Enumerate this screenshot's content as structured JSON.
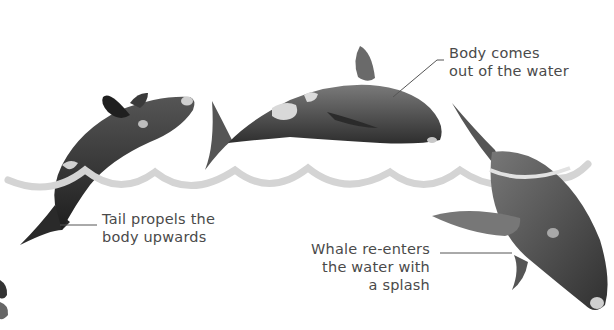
{
  "figure": {
    "colors": {
      "background": "#ffffff",
      "wave": "#d2d2d2",
      "whale_dark": "#2e2e2e",
      "whale_mid": "#5a5a5a",
      "whale_patch": "#d8d8d8",
      "label_text": "#4a4a4a",
      "leader_line": "#555555"
    },
    "labels": [
      {
        "id": "body",
        "lines": [
          "Body comes",
          "out of the water"
        ]
      },
      {
        "id": "tail",
        "lines": [
          "Tail propels the",
          "body upwards"
        ]
      },
      {
        "id": "reenter",
        "lines": [
          "Whale re-enters",
          "the water with",
          "a splash"
        ]
      }
    ],
    "stages": [
      {
        "name": "whale-rising",
        "description": "Whale rising from water, head up"
      },
      {
        "name": "whale-airborne",
        "description": "Whale fully out of the water, horizontal"
      },
      {
        "name": "whale-diving",
        "description": "Whale re-entering water head first"
      }
    ]
  }
}
